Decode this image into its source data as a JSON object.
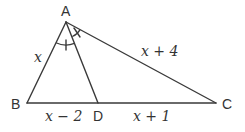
{
  "diagram": {
    "type": "triangle-angle-bisector",
    "points": {
      "A": {
        "label": "A",
        "x": 66,
        "y": 22
      },
      "B": {
        "label": "B",
        "x": 27,
        "y": 103
      },
      "C": {
        "label": "C",
        "x": 216,
        "y": 103
      },
      "D": {
        "label": "D",
        "x": 98,
        "y": 103
      }
    },
    "segments": [
      {
        "from": "A",
        "to": "B",
        "label": "x"
      },
      {
        "from": "A",
        "to": "C",
        "label": "x + 4"
      },
      {
        "from": "B",
        "to": "D",
        "label": "x − 2"
      },
      {
        "from": "D",
        "to": "C",
        "label": "x + 1"
      },
      {
        "from": "A",
        "to": "D",
        "label": ""
      }
    ],
    "annotations": {
      "angle_marks": "Angle BAD and angle DAC marked equal (AD bisects angle A)"
    },
    "colors": {
      "line": "#3a3a3a",
      "text": "#333333",
      "background": "#ffffff"
    }
  }
}
